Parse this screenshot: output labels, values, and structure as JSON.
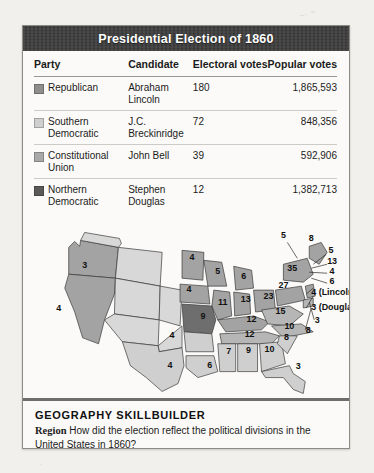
{
  "figure": {
    "title": "Presidential Election of 1860"
  },
  "table": {
    "headers": {
      "party": "Party",
      "candidate": "Candidate",
      "electoral": "Electoral votes",
      "popular": "Popular votes"
    },
    "rows": [
      {
        "party": "Republican",
        "candidate": "Abraham Lincoln",
        "electoral": "180",
        "popular": "1,865,593",
        "swatch": "#8e8e8e"
      },
      {
        "party": "Southern Democratic",
        "candidate": "J.C. Breckinridge",
        "electoral": "72",
        "popular": "848,356",
        "swatch": "#cfcfcf"
      },
      {
        "party": "Constitutional Union",
        "candidate": "John Bell",
        "electoral": "39",
        "popular": "592,906",
        "swatch": "#a9a9a9"
      },
      {
        "party": "Northern Democratic",
        "candidate": "Stephen Douglas",
        "electoral": "12",
        "popular": "1,382,713",
        "swatch": "#5a5a5a"
      }
    ]
  },
  "map": {
    "colors": {
      "republican": "#a3a3a3",
      "southern_democratic": "#cfcfcf",
      "constitutional_union": "#b6b6b6",
      "northern_democratic": "#6e6e6e",
      "territory": "#d8d8d8",
      "outline": "#3a3a3a"
    },
    "labels": [
      {
        "text": "3",
        "x": 62,
        "y": 52,
        "party": "republican"
      },
      {
        "text": "4",
        "x": 36,
        "y": 95,
        "party": "republican"
      },
      {
        "text": "4",
        "x": 170,
        "y": 44,
        "party": "republican"
      },
      {
        "text": "5",
        "x": 196,
        "y": 58,
        "party": "republican"
      },
      {
        "text": "6",
        "x": 222,
        "y": 63,
        "party": "republican"
      },
      {
        "text": "4",
        "x": 167,
        "y": 76,
        "party": "republican"
      },
      {
        "text": "11",
        "x": 201,
        "y": 89,
        "party": "republican"
      },
      {
        "text": "13",
        "x": 224,
        "y": 86,
        "party": "republican"
      },
      {
        "text": "23",
        "x": 247,
        "y": 83,
        "party": "republican"
      },
      {
        "text": "9",
        "x": 181,
        "y": 103,
        "party": "northern_democratic"
      },
      {
        "text": "12",
        "x": 230,
        "y": 106,
        "party": "republican"
      },
      {
        "text": "12",
        "x": 228,
        "y": 121,
        "party": "constitutional_union"
      },
      {
        "text": "15",
        "x": 259,
        "y": 98,
        "party": "constitutional_union"
      },
      {
        "text": "10",
        "x": 268,
        "y": 113,
        "party": "constitutional_union"
      },
      {
        "text": "27",
        "x": 262,
        "y": 72,
        "party": "republican"
      },
      {
        "text": "35",
        "x": 271,
        "y": 55,
        "party": "republican"
      },
      {
        "text": "4",
        "x": 150,
        "y": 122,
        "party": "southern_democratic"
      },
      {
        "text": "4",
        "x": 148,
        "y": 152,
        "party": "southern_democratic"
      },
      {
        "text": "6",
        "x": 188,
        "y": 152,
        "party": "southern_democratic"
      },
      {
        "text": "7",
        "x": 207,
        "y": 138,
        "party": "southern_democratic"
      },
      {
        "text": "9",
        "x": 227,
        "y": 137,
        "party": "southern_democratic"
      },
      {
        "text": "10",
        "x": 248,
        "y": 136,
        "party": "southern_democratic"
      },
      {
        "text": "8",
        "x": 265,
        "y": 124,
        "party": "southern_democratic"
      },
      {
        "text": "3",
        "x": 277,
        "y": 153,
        "party": "southern_democratic"
      }
    ],
    "callouts": [
      {
        "text": "5",
        "x": 262,
        "y": 22
      },
      {
        "text": "8",
        "x": 290,
        "y": 25
      },
      {
        "text": "5",
        "x": 310,
        "y": 37
      },
      {
        "text": "13",
        "x": 311,
        "y": 48
      },
      {
        "text": "4",
        "x": 311,
        "y": 58
      },
      {
        "text": "6",
        "x": 311,
        "y": 68
      },
      {
        "text": "4 (Lincoln)",
        "x": 290,
        "y": 79
      },
      {
        "text": "3 (Douglas)",
        "x": 290,
        "y": 94
      },
      {
        "text": "3",
        "x": 296,
        "y": 107
      },
      {
        "text": "8",
        "x": 287,
        "y": 117
      }
    ]
  },
  "caption": {
    "heading": "GEOGRAPHY SKILLBUILDER",
    "region_label": "Region",
    "question": "How did the election reflect the political divisions in the United States in 1860?"
  }
}
